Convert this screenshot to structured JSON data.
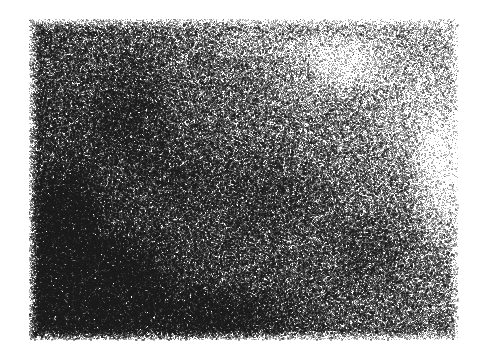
{
  "image": {
    "kind": "grain-stipple-texture",
    "description": "Dense random black-and-white stipple grain field on a white page",
    "width": 484,
    "height": 362,
    "background_color": "#ffffff",
    "dot_color": "#1a1a1a",
    "has_text": false,
    "has_axes": false,
    "has_border": false
  },
  "texture_region": {
    "left": 29,
    "top": 19,
    "right": 458,
    "bottom": 340,
    "width": 429,
    "height": 321,
    "edge_style": "soft-stippled-fade",
    "edge_feather_px": 10
  },
  "density_field": {
    "model": "bilinear-corner-interpolation-with-blobs",
    "corner_density": {
      "top_left": 0.58,
      "top_right": 0.2,
      "bottom_left": 0.95,
      "bottom_right": 0.42
    },
    "min_density": 0.12,
    "max_density": 1.0,
    "darkest_area": "lower-left",
    "lightest_area": "upper-right",
    "total_dots": 255000,
    "dot_size_px": [
      1,
      2
    ],
    "dot_opacity_range": [
      0.18,
      0.92
    ]
  },
  "blobs": [
    {
      "cx": 0.17,
      "cy": 0.82,
      "rx": 0.22,
      "ry": 0.2,
      "weight": 0.38
    },
    {
      "cx": 0.09,
      "cy": 0.62,
      "rx": 0.13,
      "ry": 0.22,
      "weight": 0.3
    },
    {
      "cx": 0.23,
      "cy": 0.28,
      "rx": 0.14,
      "ry": 0.26,
      "weight": 0.18
    },
    {
      "cx": 0.44,
      "cy": 0.92,
      "rx": 0.26,
      "ry": 0.13,
      "weight": 0.22
    },
    {
      "cx": 0.57,
      "cy": 0.55,
      "rx": 0.2,
      "ry": 0.22,
      "weight": 0.12
    },
    {
      "cx": 0.8,
      "cy": 0.72,
      "rx": 0.18,
      "ry": 0.2,
      "weight": 0.14
    },
    {
      "cx": 0.36,
      "cy": 0.47,
      "rx": 0.16,
      "ry": 0.18,
      "weight": 0.1
    },
    {
      "cx": 0.68,
      "cy": 0.2,
      "rx": 0.18,
      "ry": 0.16,
      "weight": -0.1
    },
    {
      "cx": 0.9,
      "cy": 0.3,
      "rx": 0.16,
      "ry": 0.24,
      "weight": -0.12
    }
  ],
  "voids": [
    {
      "cx": 0.74,
      "cy": 0.12,
      "rx": 0.16,
      "ry": 0.14,
      "weight": 0.22
    },
    {
      "cx": 0.96,
      "cy": 0.5,
      "rx": 0.1,
      "ry": 0.3,
      "weight": 0.26
    },
    {
      "cx": 0.55,
      "cy": 0.08,
      "rx": 0.18,
      "ry": 0.08,
      "weight": 0.16
    }
  ],
  "render": {
    "seed": 20240917,
    "grain_scale": 1.0
  }
}
